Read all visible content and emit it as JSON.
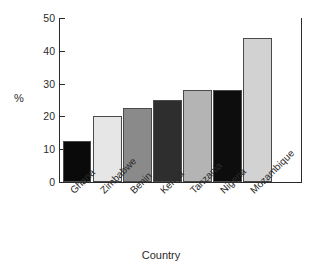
{
  "chart_data": {
    "type": "bar",
    "title": "",
    "subtitle": "",
    "xlabel": "Country",
    "ylabel": "%",
    "categories": [
      "Ghana",
      "Zimbabwe",
      "Benin",
      "Kenya",
      "Tanzania",
      "Nigeria",
      "Mozambique"
    ],
    "values": [
      12.5,
      20,
      22.5,
      25,
      28,
      28,
      43.8
    ],
    "bar_colors": [
      "#0a0a0a",
      "#e6e6e6",
      "#8a8a8a",
      "#2e2e2e",
      "#b4b4b4",
      "#0d0d0d",
      "#d2d2d2"
    ],
    "bar_border_color": "#4a4a4a",
    "ylim": [
      0,
      50
    ],
    "yticks": [
      0,
      10,
      20,
      30,
      40,
      50
    ],
    "ytick_labels": [
      "0",
      "10",
      "20",
      "30",
      "40",
      "50"
    ],
    "xtick_labels_rotation": -45,
    "grid": false,
    "legend": null,
    "legend_position": "none",
    "axis_color": "#2a2a2a",
    "background": "#ffffff"
  }
}
